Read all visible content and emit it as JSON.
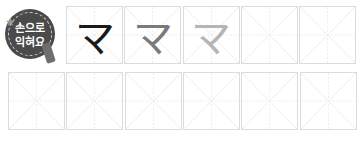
{
  "badge": {
    "line1": "손으로",
    "line2": "익혀요",
    "icon": "pencil-star-badge-icon"
  },
  "practice": {
    "character": "マ",
    "row1": [
      {
        "glyph": "マ",
        "color": "#1a1a1a"
      },
      {
        "glyph": "マ",
        "color": "#7a7a7a"
      },
      {
        "glyph": "マ",
        "color": "#b5b5b5"
      },
      {
        "glyph": "",
        "color": ""
      },
      {
        "glyph": "",
        "color": ""
      }
    ],
    "row2": [
      {
        "glyph": ""
      },
      {
        "glyph": ""
      },
      {
        "glyph": ""
      },
      {
        "glyph": ""
      },
      {
        "glyph": ""
      },
      {
        "glyph": ""
      }
    ]
  },
  "colors": {
    "grid_border": "#dcdcdc",
    "guide_line": "#ececec",
    "badge_bg": "#4a4a4a"
  }
}
